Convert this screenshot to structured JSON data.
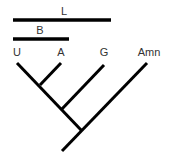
{
  "diagram": {
    "type": "cladogram",
    "taxa": [
      "U",
      "A",
      "G",
      "Amn"
    ],
    "bars": [
      {
        "label": "L",
        "spans": [
          "U",
          "A",
          "G"
        ]
      },
      {
        "label": "B",
        "spans": [
          "U",
          "A"
        ]
      }
    ],
    "colors": {
      "line": "#000000",
      "text": "#333333",
      "background": "#ffffff"
    }
  },
  "labels": {
    "bar_l": "L",
    "bar_b": "B",
    "taxon_u": "U",
    "taxon_a": "A",
    "taxon_g": "G",
    "taxon_amn": "Amn"
  }
}
